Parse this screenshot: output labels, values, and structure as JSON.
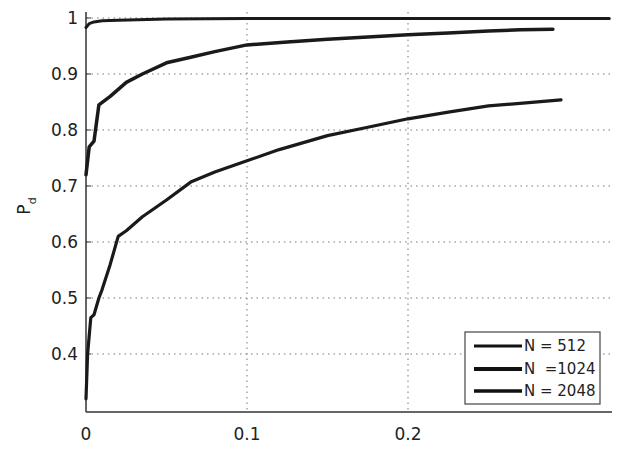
{
  "chart_data": {
    "type": "line",
    "title": "",
    "xlabel": "",
    "ylabel": "P_d",
    "ylabel_main": "P",
    "ylabel_sub": "d",
    "xlim": [
      0,
      0.325
    ],
    "ylim": [
      0.295,
      1.0
    ],
    "grid": true,
    "legend_position": "lower right",
    "x_ticks": [
      0,
      0.1,
      0.2
    ],
    "x_tick_labels": [
      "0",
      "0.1",
      "0.2"
    ],
    "y_ticks": [
      0.4,
      0.5,
      0.6,
      0.7,
      0.8,
      0.9,
      1.0
    ],
    "y_tick_labels": [
      "0.4",
      "0.5",
      "0.6",
      "0.7",
      "0.8",
      "0.9",
      "1"
    ],
    "series": [
      {
        "name": "N = 512",
        "legend_label": "N = 512",
        "color": "#1a1a1a",
        "x": [
          0,
          0.002,
          0.005,
          0.01,
          0.02,
          0.05,
          0.1,
          0.15,
          0.2,
          0.25,
          0.3,
          0.325
        ],
        "y": [
          0.983,
          0.99,
          0.993,
          0.995,
          0.996,
          0.998,
          0.999,
          0.999,
          0.999,
          0.999,
          0.999,
          0.999
        ]
      },
      {
        "name": "N = 1024",
        "legend_label": "N  =1024",
        "color": "#1a1a1a",
        "x": [
          0,
          0.002,
          0.005,
          0.008,
          0.015,
          0.025,
          0.035,
          0.05,
          0.065,
          0.08,
          0.1,
          0.125,
          0.15,
          0.175,
          0.2,
          0.225,
          0.25,
          0.27,
          0.29
        ],
        "y": [
          0.72,
          0.77,
          0.78,
          0.845,
          0.86,
          0.885,
          0.9,
          0.92,
          0.93,
          0.94,
          0.952,
          0.957,
          0.962,
          0.966,
          0.97,
          0.973,
          0.977,
          0.979,
          0.98
        ]
      },
      {
        "name": "N = 2048",
        "legend_label": "N = 2048",
        "color": "#1a1a1a",
        "x": [
          0,
          0.001,
          0.003,
          0.005,
          0.008,
          0.01,
          0.015,
          0.02,
          0.025,
          0.035,
          0.05,
          0.065,
          0.08,
          0.1,
          0.12,
          0.15,
          0.175,
          0.2,
          0.225,
          0.25,
          0.275,
          0.295
        ],
        "y": [
          0.32,
          0.4,
          0.465,
          0.47,
          0.5,
          0.515,
          0.56,
          0.61,
          0.62,
          0.645,
          0.675,
          0.707,
          0.725,
          0.745,
          0.765,
          0.79,
          0.805,
          0.82,
          0.832,
          0.843,
          0.849,
          0.854
        ]
      }
    ]
  },
  "legend": {
    "items": [
      {
        "label": "N = 512"
      },
      {
        "label": "N  =1024"
      },
      {
        "label": "N = 2048"
      }
    ]
  },
  "axes": {
    "ylabel_main": "P",
    "ylabel_sub": "d"
  }
}
